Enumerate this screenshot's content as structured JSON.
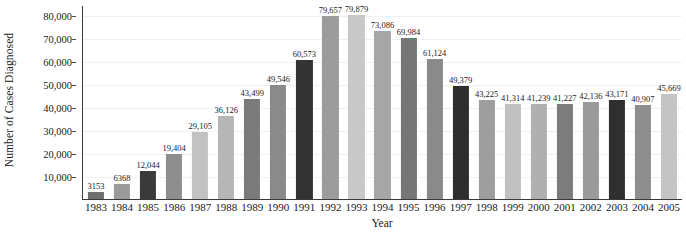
{
  "chart_data": {
    "type": "bar",
    "title": "",
    "xlabel": "Year",
    "ylabel": "Number of Cases Diagnosed",
    "categories": [
      "1983",
      "1984",
      "1985",
      "1986",
      "1987",
      "1988",
      "1989",
      "1990",
      "1991",
      "1992",
      "1993",
      "1994",
      "1995",
      "1996",
      "1997",
      "1998",
      "1999",
      "2000",
      "2001",
      "2002",
      "2003",
      "2004",
      "2005"
    ],
    "values": [
      3153,
      6368,
      12044,
      19404,
      29105,
      36126,
      43499,
      49546,
      60573,
      79657,
      79879,
      73086,
      69984,
      61124,
      49379,
      43225,
      41314,
      41239,
      41227,
      42136,
      43171,
      40907,
      45669
    ],
    "value_labels": [
      "3153",
      "6368",
      "12,044",
      "19,404",
      "29,105",
      "36,126",
      "43,499",
      "49,546",
      "60,573",
      "79,657",
      "79,879",
      "73,086",
      "69,984",
      "61,124",
      "49,379",
      "43,225",
      "41,314",
      "41,239",
      "41,227",
      "42,136",
      "43,171",
      "40,907",
      "45,669"
    ],
    "bar_colors": [
      "#6e6e6e",
      "#9a9a9a",
      "#3a3a3a",
      "#8e8e8e",
      "#c2c2c2",
      "#b6b6b6",
      "#7a7a7a",
      "#8a8a8a",
      "#333333",
      "#9c9c9c",
      "#c8c8c8",
      "#a6a6a6",
      "#767676",
      "#8a8a8a",
      "#2e2e2e",
      "#9e9e9e",
      "#c0c0c0",
      "#b0b0b0",
      "#7c7c7c",
      "#9a9a9a",
      "#2f2f2f",
      "#8e8e8e",
      "#c4c4c4"
    ],
    "ytick_values": [
      10000,
      20000,
      30000,
      40000,
      50000,
      60000,
      70000,
      80000
    ],
    "ytick_labels": [
      "10,000",
      "20,000",
      "30,000",
      "40,000",
      "50,000",
      "60,000",
      "70,000",
      "80,000"
    ],
    "ylim": [
      0,
      84000
    ],
    "grid": true,
    "legend": "none",
    "legend_position": "none"
  }
}
